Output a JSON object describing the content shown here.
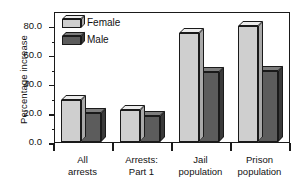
{
  "chart_data": {
    "type": "bar",
    "title": "",
    "xlabel": "",
    "ylabel": "Percentage increase",
    "ylim": [
      0,
      90
    ],
    "yticks": [
      "0.0",
      "20.0",
      "40.0",
      "60.0",
      "80.0"
    ],
    "ytick_values": [
      0,
      20,
      40,
      60,
      80
    ],
    "minor_ticks": true,
    "grid": false,
    "legend_position": "top-left",
    "categories": [
      "All arrests",
      "Arrests: Part 1",
      "Jail population",
      "Prison population"
    ],
    "category_lines": [
      [
        "All",
        "arrests"
      ],
      [
        "Arrests:",
        "Part 1"
      ],
      [
        "Jail",
        "population"
      ],
      [
        "Prison",
        "population"
      ]
    ],
    "series": [
      {
        "name": "Female",
        "color": "#cfcfcf",
        "values": [
          29,
          22,
          75,
          80
        ]
      },
      {
        "name": "Male",
        "color": "#5c5c5c",
        "values": [
          20,
          18,
          48,
          49
        ]
      }
    ]
  },
  "legend": {
    "items": [
      {
        "label": "Female"
      },
      {
        "label": "Male"
      }
    ]
  }
}
